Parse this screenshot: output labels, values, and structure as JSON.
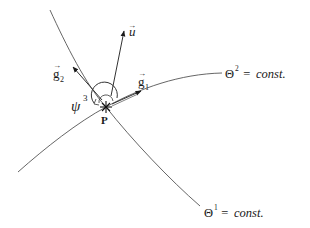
{
  "diagram": {
    "point_label": "P",
    "curves": {
      "theta1": {
        "symbol": "Θ",
        "superscript": "1",
        "rest": " = ",
        "const": "const."
      },
      "theta2": {
        "symbol": "Θ",
        "superscript": "2",
        "rest": " = ",
        "const": "const."
      }
    },
    "vectors": {
      "u": {
        "base": "u",
        "arrow": "→"
      },
      "g1": {
        "base": "g",
        "subscript": "1",
        "arrow": "→"
      },
      "g2": {
        "base": "g",
        "subscript": "2",
        "arrow": "→"
      }
    },
    "angle": {
      "symbol": "ψ",
      "superscript": "3"
    },
    "colors": {
      "line": "#555555",
      "text": "#1a1a1a"
    }
  }
}
